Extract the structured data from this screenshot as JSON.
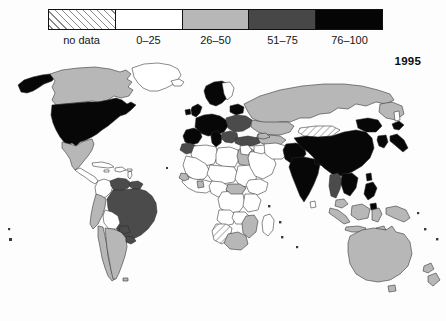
{
  "title_year": "1995",
  "legend": {
    "name": "choropleth-legend",
    "bins": [
      {
        "label": "no data",
        "key": "nodata",
        "color": "#ffffff",
        "pattern": "diagonal-hatch"
      },
      {
        "label": "0–25",
        "key": "b0",
        "color": "#ffffff"
      },
      {
        "label": "26–50",
        "key": "b26",
        "color": "#b7b7b7"
      },
      {
        "label": "51–75",
        "key": "b51",
        "color": "#474747"
      },
      {
        "label": "76–100",
        "key": "b76",
        "color": "#050505"
      }
    ]
  },
  "map": {
    "name": "world-choropleth-map",
    "projection": "equirectangular",
    "regions": [
      {
        "name": "alaska",
        "bin": "b76"
      },
      {
        "name": "canada",
        "bin": "b26"
      },
      {
        "name": "united-states",
        "bin": "b76"
      },
      {
        "name": "greenland",
        "bin": "b0"
      },
      {
        "name": "mexico",
        "bin": "b26"
      },
      {
        "name": "central-america",
        "bin": "b0"
      },
      {
        "name": "caribbean",
        "bin": "b0"
      },
      {
        "name": "colombia",
        "bin": "b0"
      },
      {
        "name": "venezuela",
        "bin": "b51"
      },
      {
        "name": "guianas",
        "bin": "b51"
      },
      {
        "name": "ecuador-peru",
        "bin": "b26"
      },
      {
        "name": "brazil",
        "bin": "b51"
      },
      {
        "name": "bolivia",
        "bin": "b0"
      },
      {
        "name": "chile",
        "bin": "b26"
      },
      {
        "name": "argentina",
        "bin": "b26"
      },
      {
        "name": "uruguay",
        "bin": "b51"
      },
      {
        "name": "western-europe",
        "bin": "b76"
      },
      {
        "name": "scandinavia",
        "bin": "b76"
      },
      {
        "name": "british-isles",
        "bin": "b76"
      },
      {
        "name": "iberia",
        "bin": "b76"
      },
      {
        "name": "italy",
        "bin": "b76"
      },
      {
        "name": "eastern-europe",
        "bin": "b51"
      },
      {
        "name": "russia",
        "bin": "b26"
      },
      {
        "name": "turkey",
        "bin": "b51"
      },
      {
        "name": "north-africa",
        "bin": "b0"
      },
      {
        "name": "morocco",
        "bin": "b51"
      },
      {
        "name": "egypt",
        "bin": "b26"
      },
      {
        "name": "sahel",
        "bin": "b0"
      },
      {
        "name": "west-africa",
        "bin": "b0"
      },
      {
        "name": "central-africa",
        "bin": "b26"
      },
      {
        "name": "east-africa",
        "bin": "b0"
      },
      {
        "name": "southern-africa",
        "bin": "nodata"
      },
      {
        "name": "mozambique",
        "bin": "b26"
      },
      {
        "name": "south-africa",
        "bin": "b26"
      },
      {
        "name": "madagascar",
        "bin": "b0"
      },
      {
        "name": "arabia",
        "bin": "b0"
      },
      {
        "name": "iran",
        "bin": "b0"
      },
      {
        "name": "central-asia",
        "bin": "b26"
      },
      {
        "name": "kazakhstan",
        "bin": "b26"
      },
      {
        "name": "afghanistan-pakistan",
        "bin": "b76"
      },
      {
        "name": "india",
        "bin": "b76"
      },
      {
        "name": "mongolia",
        "bin": "nodata"
      },
      {
        "name": "china",
        "bin": "b76"
      },
      {
        "name": "korea",
        "bin": "b76"
      },
      {
        "name": "japan",
        "bin": "b76"
      },
      {
        "name": "indochina",
        "bin": "b76"
      },
      {
        "name": "thailand",
        "bin": "b51"
      },
      {
        "name": "philippines",
        "bin": "b76"
      },
      {
        "name": "indonesia",
        "bin": "b26"
      },
      {
        "name": "malaysia",
        "bin": "b26"
      },
      {
        "name": "papua-new-guinea",
        "bin": "b26"
      },
      {
        "name": "australia",
        "bin": "b26"
      },
      {
        "name": "new-zealand",
        "bin": "b26"
      }
    ]
  }
}
